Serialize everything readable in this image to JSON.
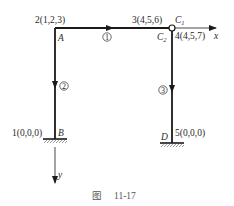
{
  "figure": {
    "caption_prefix": "图",
    "caption_number": "11-17"
  },
  "nodes": {
    "n1": {
      "label": "1(0,0,0)",
      "point": "B"
    },
    "n2": {
      "label": "2(1,2,3)",
      "point": "A"
    },
    "n3": {
      "label": "3(4,5,6)",
      "point": "C",
      "point_sub": "1"
    },
    "n4": {
      "label": "4(4,5,7)",
      "point": "C",
      "point_sub": "2"
    },
    "n5": {
      "label": "5(0,0,0)",
      "point": "D"
    }
  },
  "elements": [
    {
      "number": "1",
      "from": "A",
      "to": "C1"
    },
    {
      "number": "2",
      "from": "A",
      "to": "B"
    },
    {
      "number": "3",
      "from": "C2",
      "to": "D"
    }
  ],
  "axes": {
    "x_label": "x",
    "y_label": "y"
  },
  "colors": {
    "line": "#1a1a1a",
    "hatch": "#555555",
    "caption": "#555555"
  }
}
